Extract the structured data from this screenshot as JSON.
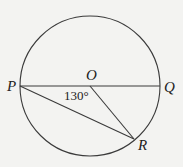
{
  "diagram": {
    "title": "",
    "points": {
      "O": {
        "label": "O",
        "role": "center"
      },
      "P": {
        "label": "P",
        "role": "diameter endpoint"
      },
      "Q": {
        "label": "Q",
        "role": "diameter endpoint"
      },
      "R": {
        "label": "R",
        "role": "point on circle"
      }
    },
    "segments": [
      "PQ",
      "PR",
      "OR"
    ],
    "angle_label": "130°",
    "angle_at": "POR"
  }
}
